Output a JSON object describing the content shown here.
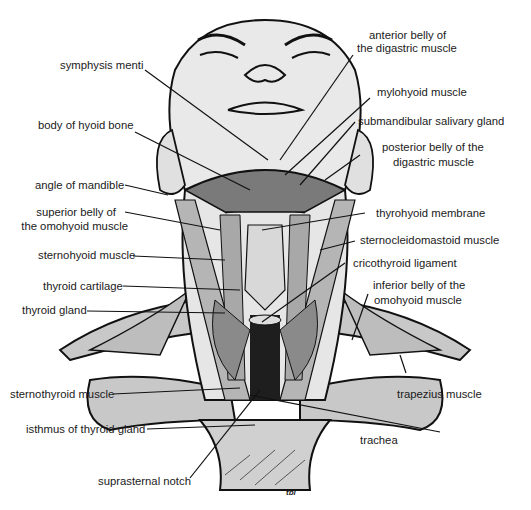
{
  "figure": {
    "signature": "tbl",
    "colors": {
      "ink": "#111111",
      "skin": "#e6e6e6",
      "muscle": "#b9b9b9",
      "dark": "#1a1a1a",
      "background": "#ffffff"
    }
  },
  "labels": {
    "left": [
      {
        "text": "symphysis menti"
      },
      {
        "text": "body of hyoid bone"
      },
      {
        "text": "angle of mandible"
      },
      {
        "text": "superior belly of"
      },
      {
        "text": "the omohyoid muscle"
      },
      {
        "text": "sternohyoid muscle"
      },
      {
        "text": "thyroid cartilage"
      },
      {
        "text": "thyroid gland"
      },
      {
        "text": "sternothyroid muscle"
      },
      {
        "text": "isthmus of thyroid gland"
      },
      {
        "text": "suprasternal notch"
      }
    ],
    "right": [
      {
        "text": "anterior belly of"
      },
      {
        "text": "the digastric muscle"
      },
      {
        "text": "mylohyoid muscle"
      },
      {
        "text": "submandibular salivary gland"
      },
      {
        "text": "posterior belly of the"
      },
      {
        "text": "digastric muscle"
      },
      {
        "text": "thyrohyoid membrane"
      },
      {
        "text": "sternocleidomastoid muscle"
      },
      {
        "text": "cricothyroid ligament"
      },
      {
        "text": "inferior belly of the"
      },
      {
        "text": "omohyoid muscle"
      },
      {
        "text": "trapezius muscle"
      },
      {
        "text": "trachea"
      }
    ]
  }
}
